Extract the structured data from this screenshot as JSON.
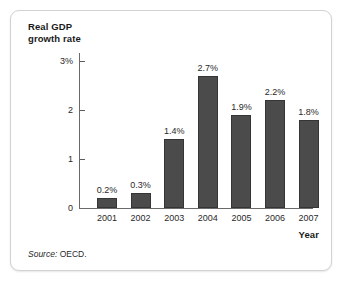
{
  "figure": {
    "source_label": "Source:",
    "source_value": "OECD.",
    "frame_color": "#d2d2d2",
    "background": "#ffffff"
  },
  "chart_data": {
    "type": "bar",
    "title": "",
    "ylabel": "Real GDP\ngrowth rate",
    "xlabel": "Year",
    "categories": [
      "2001",
      "2002",
      "2003",
      "2004",
      "2005",
      "2006",
      "2007"
    ],
    "values": [
      0.2,
      0.3,
      1.4,
      2.7,
      1.9,
      2.2,
      1.8
    ],
    "data_labels": [
      "0.2%",
      "0.3%",
      "1.4%",
      "2.7%",
      "1.9%",
      "2.2%",
      "1.8%"
    ],
    "ylim": [
      0,
      3
    ],
    "ytick_values": [
      0,
      1,
      2,
      3
    ],
    "ytick_labels": [
      "0",
      "1",
      "2",
      "3%"
    ],
    "grid": false,
    "legend": "none",
    "bar_color": "#4b4b4b",
    "bar_edge_color": "#353535"
  }
}
